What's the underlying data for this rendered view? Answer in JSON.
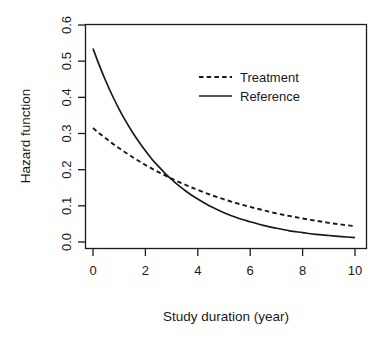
{
  "chart_data": {
    "type": "line",
    "title": "",
    "xlabel": "Study duration (year)",
    "ylabel": "Hazard function",
    "xlim": [
      0,
      10
    ],
    "ylim": [
      0.0,
      0.6
    ],
    "xticks": [
      "0",
      "2",
      "4",
      "6",
      "8",
      "10"
    ],
    "xtick_values": [
      0,
      2,
      4,
      6,
      8,
      10
    ],
    "yticks": [
      "0.0",
      "0.1",
      "0.2",
      "0.3",
      "0.4",
      "0.5",
      "0.6"
    ],
    "ytick_values": [
      0.0,
      0.1,
      0.2,
      0.3,
      0.4,
      0.5,
      0.6
    ],
    "grid": false,
    "legend_position": "top-right",
    "x": [
      0,
      0.25,
      0.5,
      0.75,
      1,
      1.25,
      1.5,
      1.75,
      2,
      2.25,
      2.5,
      2.75,
      3,
      3.25,
      3.5,
      3.75,
      4,
      4.5,
      5,
      5.5,
      6,
      6.5,
      7,
      7.5,
      8,
      8.5,
      9,
      9.5,
      10
    ],
    "series": [
      {
        "name": "Treatment",
        "style": "dashed",
        "color": "#1a1a1a",
        "values": [
          0.315,
          0.3,
          0.286,
          0.272,
          0.259,
          0.247,
          0.235,
          0.224,
          0.213,
          0.203,
          0.193,
          0.184,
          0.175,
          0.167,
          0.159,
          0.151,
          0.144,
          0.13,
          0.118,
          0.107,
          0.097,
          0.088,
          0.079,
          0.072,
          0.065,
          0.059,
          0.053,
          0.048,
          0.044
        ]
      },
      {
        "name": "Reference",
        "style": "solid",
        "color": "#1a1a1a",
        "values": [
          0.535,
          0.487,
          0.443,
          0.403,
          0.367,
          0.334,
          0.304,
          0.277,
          0.252,
          0.229,
          0.209,
          0.19,
          0.173,
          0.157,
          0.143,
          0.13,
          0.119,
          0.098,
          0.081,
          0.067,
          0.056,
          0.046,
          0.038,
          0.031,
          0.026,
          0.021,
          0.018,
          0.015,
          0.012
        ]
      }
    ],
    "annotations": [
      {
        "text": "curves cross near x = 3.5",
        "visible": false
      }
    ]
  },
  "legend": {
    "entries": [
      {
        "label": "Treatment",
        "style": "dashed"
      },
      {
        "label": "Reference",
        "style": "solid"
      }
    ]
  },
  "axes": {
    "x_title": "Study duration (year)",
    "y_title": "Hazard function"
  },
  "colors": {
    "foreground": "#1a1a1a",
    "background": "#ffffff"
  }
}
